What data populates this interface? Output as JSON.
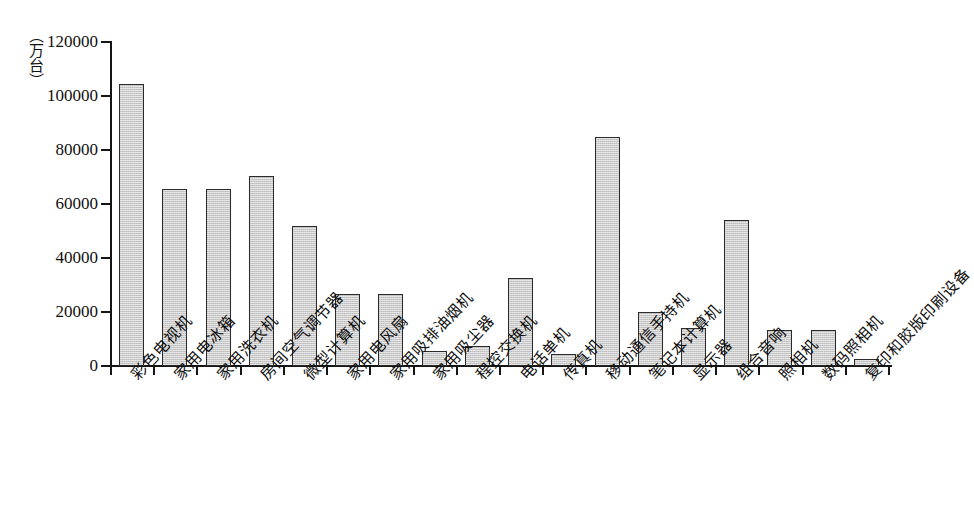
{
  "chart_data": {
    "type": "bar",
    "title": "",
    "xlabel": "",
    "ylabel": "（万台）",
    "unit_caption": "（万台）",
    "ylim": [
      0,
      120000
    ],
    "yticks": [
      0,
      20000,
      40000,
      60000,
      80000,
      100000,
      120000
    ],
    "ytick_labels": [
      "0",
      "20000",
      "40000",
      "60000",
      "80000",
      "100000",
      "120000"
    ],
    "grid": false,
    "legend": "none",
    "bar_fill_color": "#c9c9c9",
    "bar_border_color": "#2b2b2b",
    "categories": [
      "彩色电视机",
      "家用电冰箱",
      "家用洗衣机",
      "房间空气调节器",
      "微型计算机",
      "家用电风扇",
      "家用吸排油烟机",
      "家用吸尘器",
      "程控交换机",
      "电话单机",
      "传真机",
      "移动通信手持机",
      "笔记本计算机",
      "显示器",
      "组合音响",
      "照相机",
      "数码照相机",
      "复印和胶版印刷设备"
    ],
    "values": [
      104500,
      65500,
      65500,
      70500,
      52000,
      26500,
      26500,
      5500,
      7500,
      32500,
      4500,
      85000,
      20000,
      14000,
      54000,
      13500,
      13500,
      2500
    ]
  }
}
